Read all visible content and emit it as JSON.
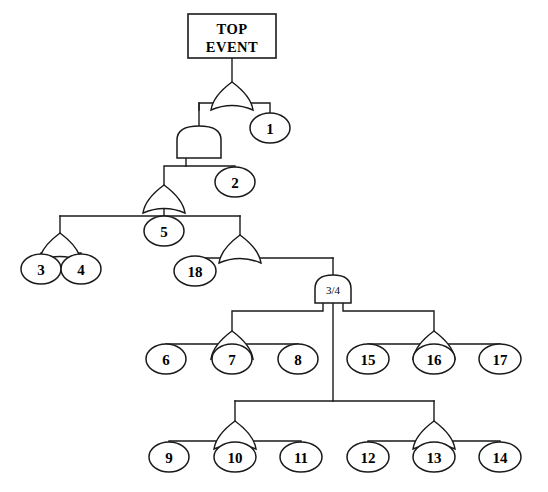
{
  "diagram": {
    "background_color": "#ffffff",
    "line_color": "#1a1a1a"
  },
  "top_event": {
    "line1": "TOP",
    "line2": "EVENT",
    "shape": "rectangle"
  },
  "gates": [
    {
      "id": "G0",
      "type": "or",
      "label": "",
      "x": 232,
      "y": 82,
      "output_to": "top_event"
    },
    {
      "id": "G1",
      "type": "and",
      "label": "",
      "x": 199,
      "y": 126,
      "output_to": "G0"
    },
    {
      "id": "G2",
      "type": "or",
      "label": "",
      "x": 164,
      "y": 185,
      "output_to": "G1"
    },
    {
      "id": "G3",
      "type": "or",
      "label": "",
      "x": 60,
      "y": 233,
      "output_to": "G2"
    },
    {
      "id": "G4",
      "type": "or",
      "label": "",
      "x": 240,
      "y": 235,
      "output_to": "G2"
    },
    {
      "id": "G5",
      "type": "vote",
      "label": "3/4",
      "x": 333,
      "y": 275,
      "output_to": "G4"
    },
    {
      "id": "G6",
      "type": "or",
      "label": "",
      "x": 232,
      "y": 331,
      "output_to": "G5"
    },
    {
      "id": "G7",
      "type": "or",
      "label": "",
      "x": 434,
      "y": 331,
      "output_to": "G5"
    },
    {
      "id": "G8",
      "type": "or",
      "label": "",
      "x": 235,
      "y": 421,
      "output_to": "G5"
    },
    {
      "id": "G9",
      "type": "or",
      "label": "",
      "x": 434,
      "y": 421,
      "output_to": "G5"
    }
  ],
  "basic_events": [
    {
      "id": "E1",
      "label": "1",
      "cx": 270,
      "cy": 128,
      "parent": "G0"
    },
    {
      "id": "E2",
      "label": "2",
      "cx": 235,
      "cy": 182,
      "parent": "G1"
    },
    {
      "id": "E5",
      "label": "5",
      "cx": 164,
      "cy": 231,
      "parent": "G2"
    },
    {
      "id": "E3",
      "label": "3",
      "cx": 41,
      "cy": 269,
      "parent": "G3"
    },
    {
      "id": "E4",
      "label": "4",
      "cx": 81,
      "cy": 269,
      "parent": "G3"
    },
    {
      "id": "E18",
      "label": "18",
      "cx": 195,
      "cy": 271,
      "parent": "G4"
    },
    {
      "id": "E6",
      "label": "6",
      "cx": 166,
      "cy": 359,
      "parent": "G6"
    },
    {
      "id": "E7",
      "label": "7",
      "cx": 232,
      "cy": 359,
      "parent": "G6"
    },
    {
      "id": "E8",
      "label": "8",
      "cx": 298,
      "cy": 359,
      "parent": "G6"
    },
    {
      "id": "E15",
      "label": "15",
      "cx": 368,
      "cy": 359,
      "parent": "G7"
    },
    {
      "id": "E16",
      "label": "16",
      "cx": 434,
      "cy": 359,
      "parent": "G7"
    },
    {
      "id": "E17",
      "label": "17",
      "cx": 500,
      "cy": 359,
      "parent": "G7"
    },
    {
      "id": "E9",
      "label": "9",
      "cx": 169,
      "cy": 457,
      "parent": "G8"
    },
    {
      "id": "E10",
      "label": "10",
      "cx": 235,
      "cy": 457,
      "parent": "G8"
    },
    {
      "id": "E11",
      "label": "11",
      "cx": 301,
      "cy": 457,
      "parent": "G8"
    },
    {
      "id": "E12",
      "label": "12",
      "cx": 368,
      "cy": 457,
      "parent": "G9"
    },
    {
      "id": "E13",
      "label": "13",
      "cx": 434,
      "cy": 457,
      "parent": "G9"
    },
    {
      "id": "E14",
      "label": "14",
      "cx": 500,
      "cy": 457,
      "parent": "G9"
    }
  ]
}
